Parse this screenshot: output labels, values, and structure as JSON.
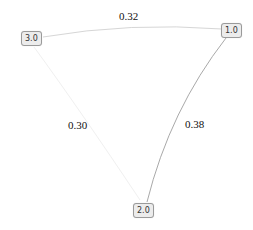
{
  "graph": {
    "nodes": [
      {
        "id": "n3",
        "label": "3.0",
        "x": 21,
        "y": 31
      },
      {
        "id": "n1",
        "label": "1.0",
        "x": 221,
        "y": 23
      },
      {
        "id": "n2",
        "label": "2.0",
        "x": 133,
        "y": 203
      }
    ],
    "edges": [
      {
        "from": "3.0",
        "to": "1.0",
        "weight": "0.32",
        "color": "#d6d6d6"
      },
      {
        "from": "3.0",
        "to": "2.0",
        "weight": "0.30",
        "color": "#ececec"
      },
      {
        "from": "1.0",
        "to": "2.0",
        "weight": "0.38",
        "color": "#a9a9a9"
      }
    ]
  }
}
